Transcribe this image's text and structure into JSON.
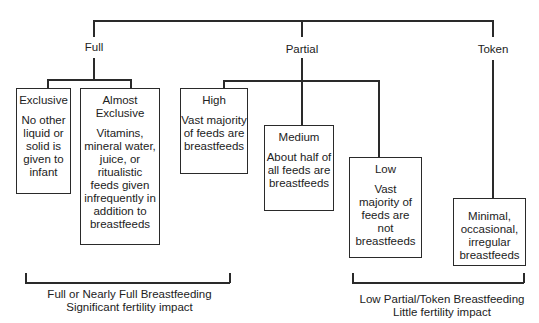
{
  "diagram": {
    "categories": [
      {
        "label": "Full"
      },
      {
        "label": "Partial"
      },
      {
        "label": "Token"
      }
    ],
    "boxes": {
      "exclusive": {
        "title": "Exclusive",
        "desc": "No other liquid or solid is given to infant"
      },
      "almost_exclusive": {
        "title": "Almost Exclusive",
        "desc": "Vitamins, mineral water, juice, or ritualistic feeds given infrequently in addition to breastfeeds"
      },
      "high": {
        "title": "High",
        "desc": "Vast majority of feeds are breastfeeds"
      },
      "medium": {
        "title": "Medium",
        "desc": "About half of all feeds are breastfeeds"
      },
      "low": {
        "title": "Low",
        "desc": "Vast majority of feeds are not breastfeeds"
      },
      "token": {
        "title": "",
        "desc": "Minimal, occasional, irregular breastfeeds"
      }
    },
    "brackets": [
      {
        "line1": "Full or Nearly Full Breastfeeding",
        "line2": "Significant fertility impact"
      },
      {
        "line1": "Low Partial/Token Breastfeeding",
        "line2": "Little fertility impact"
      }
    ],
    "colors": {
      "line": "#2a2a2a",
      "text": "#222222",
      "background": "#ffffff"
    }
  }
}
